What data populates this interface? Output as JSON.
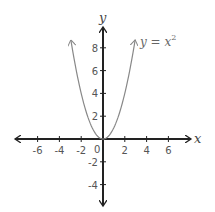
{
  "chart_data": {
    "type": "line",
    "title": "",
    "xlabel": "x",
    "ylabel": "y",
    "xlim": [
      -7.5,
      7.5
    ],
    "ylim": [
      -5.9,
      9.8
    ],
    "grid": false,
    "x_ticks": [
      "-6",
      "-4",
      "-2",
      "0",
      "2",
      "4",
      "6"
    ],
    "y_ticks": [
      "-4",
      "-2",
      "2",
      "4",
      "6",
      "8"
    ],
    "annotations": [
      {
        "text": "y = x",
        "superscript": "2",
        "near": [
          3.3,
          8.5
        ]
      }
    ],
    "series": [
      {
        "name": "y = x^2",
        "function": "x^2",
        "x": [
          -2.95,
          -2.5,
          -2,
          -1.5,
          -1,
          -0.5,
          0,
          0.5,
          1,
          1.5,
          2,
          2.5,
          2.95
        ],
        "values": [
          8.7,
          6.25,
          4,
          2.25,
          1,
          0.25,
          0,
          0.25,
          1,
          2.25,
          4,
          6.25,
          8.7
        ],
        "color": "#888888"
      }
    ]
  },
  "labels": {
    "x_axis": "x",
    "y_axis": "y",
    "curve": "y = x",
    "curve_exp": "2",
    "origin": "0"
  }
}
